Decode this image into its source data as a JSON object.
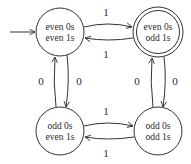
{
  "diagram": {
    "type": "finite-state-automaton",
    "colors": {
      "stroke": "#333333",
      "text": "#2a2a2a",
      "background": "#ffffff"
    },
    "start_state": "s_ee",
    "states": [
      {
        "id": "s_ee",
        "line1": "even 0s",
        "line2": "even 1s",
        "accepting": false,
        "start": true
      },
      {
        "id": "s_eo",
        "line1": "even 0s",
        "line2": "odd 1s",
        "accepting": true,
        "start": false
      },
      {
        "id": "s_oe",
        "line1": "odd 0s",
        "line2": "even 1s",
        "accepting": false,
        "start": false
      },
      {
        "id": "s_oo",
        "line1": "odd 0s",
        "line2": "odd 1s",
        "accepting": false,
        "start": false
      }
    ],
    "edges": [
      {
        "from": "s_ee",
        "to": "s_eo",
        "label": "1"
      },
      {
        "from": "s_eo",
        "to": "s_ee",
        "label": "1"
      },
      {
        "from": "s_oe",
        "to": "s_oo",
        "label": "1"
      },
      {
        "from": "s_oo",
        "to": "s_oe",
        "label": "1"
      },
      {
        "from": "s_oe",
        "to": "s_ee",
        "label": "0"
      },
      {
        "from": "s_ee",
        "to": "s_oe",
        "label": "0"
      },
      {
        "from": "s_oo",
        "to": "s_eo",
        "label": "0"
      },
      {
        "from": "s_eo",
        "to": "s_oo",
        "label": "0"
      }
    ]
  }
}
